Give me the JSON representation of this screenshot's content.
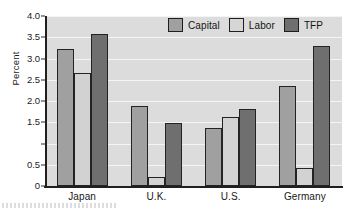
{
  "chart_data": {
    "type": "bar",
    "title": "",
    "subtitle": "",
    "xlabel": "",
    "ylabel": "Percent",
    "categories": [
      "Japan",
      "U.K.",
      "U.S.",
      "Germany"
    ],
    "series": [
      {
        "name": "Capital",
        "color": "#a0a0a0",
        "values": [
          3.22,
          1.88,
          1.37,
          2.35
        ]
      },
      {
        "name": "Labor",
        "color": "#d2d2d2",
        "values": [
          2.65,
          0.22,
          1.62,
          0.43
        ]
      },
      {
        "name": "TFP",
        "color": "#6f6f6f",
        "values": [
          3.57,
          1.48,
          1.82,
          3.3
        ]
      }
    ],
    "ylim": [
      0,
      4.0
    ],
    "ytick_values": [
      4.0,
      3.5,
      3.0,
      2.5,
      2.0,
      1.5,
      1.0,
      0.5,
      0
    ],
    "ytick_labels": [
      "4.0",
      "3.5",
      "3.0",
      "2.5",
      "2.0",
      "1.5",
      "",
      "0.5",
      "0"
    ],
    "grid": true,
    "grid_axis": "y",
    "legend_position": "top-right-inside",
    "plot_background": "#dcdcdc",
    "gridline_color": "#f4f4f4",
    "axis_color": "#1f1f1f"
  },
  "axis": {
    "ylabel": "Percent"
  },
  "legend": {
    "items": [
      {
        "label": "Capital"
      },
      {
        "label": "Labor"
      },
      {
        "label": "TFP"
      }
    ]
  }
}
